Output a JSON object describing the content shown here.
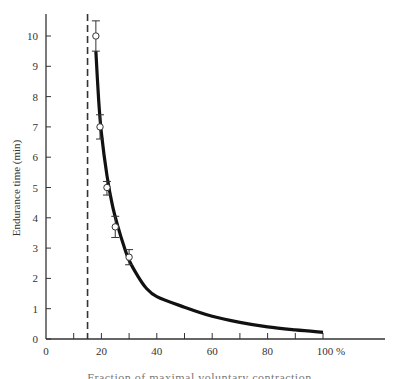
{
  "chart_data": {
    "type": "line",
    "title": "",
    "xlabel": "Fraction of maximal voluntary contraction",
    "ylabel": "Endurance time (min)",
    "xlim": [
      0,
      120
    ],
    "ylim": [
      0,
      10.7
    ],
    "x_ticks": [
      0,
      20,
      40,
      60,
      80,
      100
    ],
    "x_tick_labels": [
      "0",
      "20",
      "40",
      "60",
      "80",
      "100 %"
    ],
    "x_minor_ticks": [
      10,
      30,
      50,
      70,
      90
    ],
    "y_ticks": [
      0,
      1,
      2,
      3,
      4,
      5,
      6,
      7,
      8,
      9,
      10
    ],
    "y_tick_labels": [
      "0",
      "1",
      "2",
      "3",
      "4",
      "5",
      "6",
      "7",
      "8",
      "9",
      "10"
    ],
    "grid": false,
    "legend": null,
    "series": [
      {
        "name": "fitted curve",
        "style": "solid-thick",
        "x": [
          18,
          19,
          20,
          22,
          24,
          26,
          28,
          30,
          33,
          36,
          40,
          50,
          60,
          70,
          80,
          90,
          100
        ],
        "y": [
          9.5,
          7.9,
          6.8,
          5.4,
          4.4,
          3.7,
          3.1,
          2.6,
          2.1,
          1.7,
          1.4,
          1.05,
          0.75,
          0.55,
          0.4,
          0.3,
          0.22
        ]
      },
      {
        "name": "measured",
        "style": "open-circle-with-error-bars",
        "x": [
          18,
          19.5,
          22,
          25,
          30
        ],
        "y": [
          10,
          7,
          5,
          3.7,
          2.7
        ],
        "err_low": [
          0.5,
          0.4,
          0.25,
          0.35,
          0.25
        ],
        "err_high": [
          0.5,
          0.4,
          0.2,
          0.35,
          0.25
        ]
      }
    ],
    "annotations": [
      {
        "type": "vertical-dashed-line",
        "x": 15
      }
    ]
  }
}
